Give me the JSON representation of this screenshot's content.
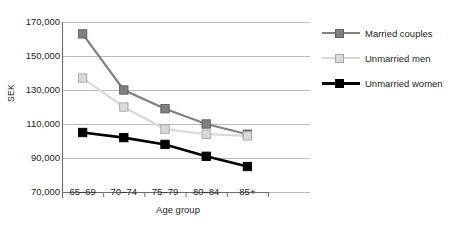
{
  "chart_data": {
    "type": "line",
    "title": "",
    "xlabel": "Age group",
    "ylabel": "SEK",
    "categories": [
      "65–69",
      "70–74",
      "75–79",
      "80–84",
      "85+"
    ],
    "ylim": [
      70000,
      170000
    ],
    "yticks": [
      70000,
      90000,
      110000,
      130000,
      150000,
      170000
    ],
    "ytick_labels": [
      "70,000",
      "90,000",
      "110,000",
      "130,000",
      "150,000",
      "170,000"
    ],
    "grid": true,
    "legend_position": "right",
    "series": [
      {
        "name": "Married couples",
        "color": "#808080",
        "marker": "square",
        "values": [
          163000,
          130000,
          119000,
          110000,
          104000
        ]
      },
      {
        "name": "Unmarried men",
        "color": "#d9d9d9",
        "marker": "square",
        "values": [
          137000,
          120000,
          107000,
          104000,
          103000
        ]
      },
      {
        "name": "Unmarried women",
        "color": "#000000",
        "marker": "square",
        "values": [
          105000,
          102000,
          98000,
          91000,
          85000
        ]
      }
    ]
  },
  "axis": {
    "y_title": "SEK",
    "x_title": "Age group"
  },
  "colors": {
    "married": "#808080",
    "unmarried_men": "#d9d9d9",
    "unmarried_women": "#000000",
    "grid": "#b3b3b3",
    "axis": "#6d6e71",
    "text": "#231f20"
  }
}
